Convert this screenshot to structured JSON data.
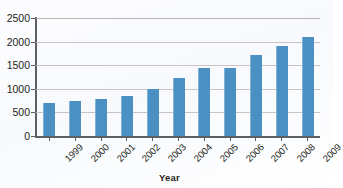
{
  "chart_data": {
    "type": "bar",
    "title": "",
    "subtitle": "",
    "xlabel": "Year",
    "ylabel": "",
    "categories": [
      "1999",
      "2000",
      "2001",
      "2002",
      "2003",
      "2004",
      "2005",
      "2006",
      "2007",
      "2008",
      "2009"
    ],
    "values": [
      700,
      750,
      790,
      850,
      1000,
      1230,
      1440,
      1450,
      1710,
      1900,
      2090
    ],
    "series": [
      {
        "name": "",
        "values": [
          700,
          750,
          790,
          850,
          1000,
          1230,
          1440,
          1450,
          1710,
          1900,
          2090
        ]
      }
    ],
    "ylim": [
      0,
      2500
    ],
    "ytick_values": [
      0,
      500,
      1000,
      1500,
      2000,
      2500
    ],
    "ytick_labels": [
      "0",
      "500",
      "1000",
      "1500",
      "2000",
      "2500"
    ],
    "grid": true,
    "grid_axis": "y",
    "legend": false,
    "legend_position": "none",
    "annotations": [],
    "colors": {
      "bar": "#4a90c2",
      "bar_highlight": "#7fb4d8",
      "gridline": "#c9c3c6",
      "axis": "#5c5f63",
      "text": "#231f20",
      "background": "#ffffff"
    },
    "xtick_label_rotation": -45
  }
}
